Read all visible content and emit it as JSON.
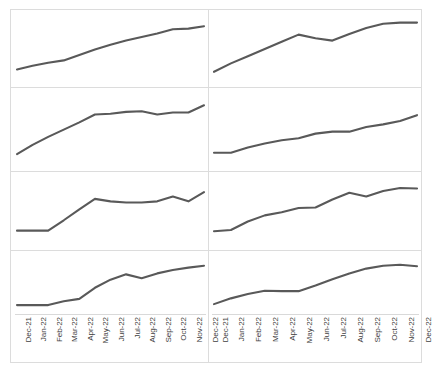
{
  "figure": {
    "type": "small-multiples-line-grid",
    "rows": 4,
    "columns": 2,
    "line_color": "#595959",
    "grid_color": "#dcdcdc",
    "background": "#ffffff"
  },
  "axis": {
    "categories": [
      "Dec-21",
      "Jan-22",
      "Feb-22",
      "Mar-22",
      "Apr-22",
      "May-22",
      "Jun-22",
      "Jul-22",
      "Aug-22",
      "Sep-22",
      "Oct-22",
      "Nov-22",
      "Dec-22"
    ],
    "label_rotation_degrees": -90
  },
  "chart_data": [
    {
      "type": "line",
      "title": "",
      "xlabel": "",
      "ylabel": "",
      "panel": "row1-col1",
      "grid": false,
      "legend": "none",
      "x": [
        "Dec-21",
        "Jan-22",
        "Feb-22",
        "Mar-22",
        "Apr-22",
        "May-22",
        "Jun-22",
        "Jul-22",
        "Aug-22",
        "Sep-22",
        "Oct-22",
        "Nov-22",
        "Dec-22"
      ],
      "values": [
        16,
        22,
        27,
        31,
        40,
        49,
        57,
        64,
        70,
        76,
        83,
        84,
        88
      ],
      "ylim": [
        0,
        100
      ]
    },
    {
      "type": "line",
      "title": "",
      "xlabel": "",
      "ylabel": "",
      "panel": "row1-col2",
      "grid": false,
      "legend": "none",
      "x": [
        "Dec-21",
        "Jan-22",
        "Feb-22",
        "Mar-22",
        "Apr-22",
        "May-22",
        "Jun-22",
        "Jul-22",
        "Aug-22",
        "Sep-22",
        "Oct-22",
        "Nov-22",
        "Dec-22"
      ],
      "values": [
        12,
        26,
        38,
        50,
        62,
        74,
        68,
        64,
        75,
        85,
        92,
        94,
        94
      ],
      "ylim": [
        0,
        100
      ]
    },
    {
      "type": "line",
      "title": "",
      "xlabel": "",
      "ylabel": "",
      "panel": "row2-col1",
      "grid": false,
      "legend": "none",
      "x": [
        "Dec-21",
        "Jan-22",
        "Feb-22",
        "Mar-22",
        "Apr-22",
        "May-22",
        "Jun-22",
        "Jul-22",
        "Aug-22",
        "Sep-22",
        "Oct-22",
        "Nov-22",
        "Dec-22"
      ],
      "values": [
        12,
        26,
        38,
        49,
        60,
        72,
        73,
        76,
        77,
        72,
        75,
        75,
        86
      ],
      "ylim": [
        0,
        100
      ]
    },
    {
      "type": "line",
      "title": "",
      "xlabel": "",
      "ylabel": "",
      "panel": "row2-col2",
      "grid": false,
      "legend": "none",
      "x": [
        "Dec-21",
        "Jan-22",
        "Feb-22",
        "Mar-22",
        "Apr-22",
        "May-22",
        "Jun-22",
        "Jul-22",
        "Aug-22",
        "Sep-22",
        "Oct-22",
        "Nov-22",
        "Dec-22"
      ],
      "values": [
        14,
        14,
        22,
        28,
        33,
        36,
        43,
        46,
        46,
        53,
        57,
        62,
        71
      ],
      "ylim": [
        0,
        100
      ]
    },
    {
      "type": "line",
      "title": "",
      "xlabel": "",
      "ylabel": "",
      "panel": "row3-col1",
      "grid": false,
      "legend": "none",
      "x": [
        "Dec-21",
        "Jan-22",
        "Feb-22",
        "Mar-22",
        "Apr-22",
        "May-22",
        "Jun-22",
        "Jul-22",
        "Aug-22",
        "Sep-22",
        "Oct-22",
        "Nov-22",
        "Dec-22"
      ],
      "values": [
        17,
        17,
        17,
        34,
        52,
        69,
        65,
        63,
        63,
        65,
        73,
        65,
        80
      ],
      "ylim": [
        0,
        100
      ]
    },
    {
      "type": "line",
      "title": "",
      "xlabel": "",
      "ylabel": "",
      "panel": "row3-col2",
      "grid": false,
      "legend": "none",
      "x": [
        "Dec-21",
        "Jan-22",
        "Feb-22",
        "Mar-22",
        "Apr-22",
        "May-22",
        "Jun-22",
        "Jul-22",
        "Aug-22",
        "Sep-22",
        "Oct-22",
        "Nov-22",
        "Dec-22"
      ],
      "values": [
        16,
        18,
        32,
        42,
        47,
        54,
        55,
        68,
        79,
        73,
        82,
        87,
        86
      ],
      "ylim": [
        0,
        100
      ]
    },
    {
      "type": "line",
      "title": "",
      "xlabel": "",
      "ylabel": "",
      "panel": "row4-col1",
      "grid": false,
      "legend": "none",
      "x": [
        "Dec-21",
        "Jan-22",
        "Feb-22",
        "Mar-22",
        "Apr-22",
        "May-22",
        "Jun-22",
        "Jul-22",
        "Aug-22",
        "Sep-22",
        "Oct-22",
        "Nov-22",
        "Dec-22"
      ],
      "values": [
        4,
        4,
        4,
        12,
        17,
        40,
        57,
        68,
        60,
        70,
        77,
        82,
        86
      ],
      "ylim": [
        0,
        100
      ]
    },
    {
      "type": "line",
      "title": "",
      "xlabel": "",
      "ylabel": "",
      "panel": "row4-col2",
      "grid": false,
      "legend": "none",
      "x": [
        "Dec-21",
        "Jan-22",
        "Feb-22",
        "Mar-22",
        "Apr-22",
        "May-22",
        "Jun-22",
        "Jul-22",
        "Aug-22",
        "Sep-22",
        "Oct-22",
        "Nov-22",
        "Dec-22"
      ],
      "values": [
        6,
        18,
        27,
        34,
        33,
        33,
        45,
        58,
        70,
        80,
        86,
        88,
        85
      ],
      "ylim": [
        0,
        100
      ]
    }
  ]
}
